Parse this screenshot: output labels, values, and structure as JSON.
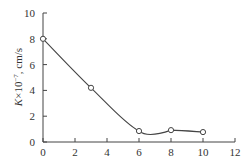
{
  "chart_data": {
    "type": "line",
    "title": "",
    "xlabel": "",
    "ylabel": "K×10⁻⁷, cm/s",
    "ylabel_parts": {
      "k": "K",
      "mult": "×10",
      "exp": "−7",
      "unit": ", cm/s"
    },
    "xlim": [
      0,
      12
    ],
    "ylim": [
      0,
      10
    ],
    "x_ticks": [
      0,
      2,
      4,
      6,
      8,
      10,
      12
    ],
    "y_ticks": [
      0,
      2,
      4,
      6,
      8,
      10
    ],
    "grid": false,
    "legend": null,
    "series": [
      {
        "name": "K",
        "marker": "open-circle",
        "smooth": true,
        "x": [
          0,
          3,
          6,
          8,
          10
        ],
        "y": [
          8.0,
          4.2,
          0.85,
          0.92,
          0.77
        ]
      }
    ],
    "colors": {
      "line": "#444444",
      "axis": "#444444",
      "text": "#333333"
    }
  }
}
